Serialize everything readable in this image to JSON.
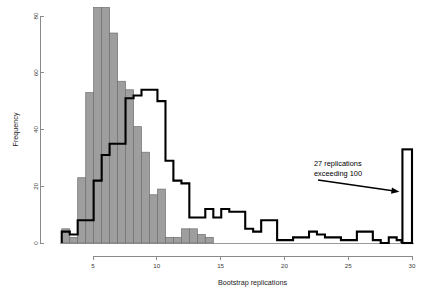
{
  "chart_data": {
    "type": "bar",
    "title": "",
    "subtitle": "",
    "xlabel": "Bootstrap replications",
    "ylabel": "Frequency",
    "xlim": [
      2.2,
      30.2
    ],
    "ylim": [
      0,
      84
    ],
    "grid": false,
    "legend_position": "none",
    "x_ticks": [
      5,
      10,
      15,
      20,
      25,
      30
    ],
    "x_tick_labels": [
      "5",
      "10",
      "15",
      "20",
      "25",
      "30"
    ],
    "y_ticks": [
      0,
      20,
      40,
      60,
      80
    ],
    "y_tick_labels": [
      "0",
      "20",
      "40",
      "60",
      "80"
    ],
    "bin_width": 0.625,
    "annotations": [
      {
        "name": "overflow-note",
        "line1": "27 replications",
        "line2": "exceeding 100",
        "points_to": "overflow-bar",
        "value": 27
      }
    ],
    "series": [
      {
        "name": "gray-histogram",
        "style": "filled-bars",
        "color": "#9e9e9e",
        "edge_color": "#6f6f6f",
        "bins": [
          {
            "x0": 2.55,
            "x1": 3.18,
            "value": 5
          },
          {
            "x0": 3.18,
            "x1": 3.8,
            "value": 2
          },
          {
            "x0": 3.8,
            "x1": 4.43,
            "value": 23
          },
          {
            "x0": 4.43,
            "x1": 5.05,
            "value": 53
          },
          {
            "x0": 5.05,
            "x1": 5.68,
            "value": 83
          },
          {
            "x0": 5.68,
            "x1": 6.3,
            "value": 83
          },
          {
            "x0": 6.3,
            "x1": 6.93,
            "value": 74
          },
          {
            "x0": 6.93,
            "x1": 7.55,
            "value": 57
          },
          {
            "x0": 7.55,
            "x1": 8.18,
            "value": 54
          },
          {
            "x0": 8.18,
            "x1": 8.8,
            "value": 41
          },
          {
            "x0": 8.8,
            "x1": 9.43,
            "value": 32
          },
          {
            "x0": 9.43,
            "x1": 10.05,
            "value": 17
          },
          {
            "x0": 10.05,
            "x1": 10.68,
            "value": 19
          },
          {
            "x0": 10.68,
            "x1": 11.3,
            "value": 2
          },
          {
            "x0": 11.3,
            "x1": 11.93,
            "value": 2
          },
          {
            "x0": 11.93,
            "x1": 12.55,
            "value": 5
          },
          {
            "x0": 12.55,
            "x1": 13.18,
            "value": 5
          },
          {
            "x0": 13.18,
            "x1": 13.8,
            "value": 3
          },
          {
            "x0": 13.8,
            "x1": 14.43,
            "value": 2
          }
        ]
      },
      {
        "name": "black-outline-histogram",
        "style": "step-outline",
        "color": "#000000",
        "bins": [
          {
            "x0": 2.55,
            "x1": 3.18,
            "value": 4
          },
          {
            "x0": 3.18,
            "x1": 3.8,
            "value": 3
          },
          {
            "x0": 3.8,
            "x1": 4.43,
            "value": 8
          },
          {
            "x0": 4.43,
            "x1": 5.05,
            "value": 8
          },
          {
            "x0": 5.05,
            "x1": 5.68,
            "value": 22
          },
          {
            "x0": 5.68,
            "x1": 6.3,
            "value": 31
          },
          {
            "x0": 6.3,
            "x1": 6.93,
            "value": 35
          },
          {
            "x0": 6.93,
            "x1": 7.55,
            "value": 35
          },
          {
            "x0": 7.55,
            "x1": 8.18,
            "value": 51
          },
          {
            "x0": 8.18,
            "x1": 8.8,
            "value": 52
          },
          {
            "x0": 8.8,
            "x1": 9.43,
            "value": 54
          },
          {
            "x0": 9.43,
            "x1": 10.05,
            "value": 54
          },
          {
            "x0": 10.05,
            "x1": 10.68,
            "value": 50
          },
          {
            "x0": 10.68,
            "x1": 11.3,
            "value": 29
          },
          {
            "x0": 11.3,
            "x1": 11.93,
            "value": 22
          },
          {
            "x0": 11.93,
            "x1": 12.55,
            "value": 21
          },
          {
            "x0": 12.55,
            "x1": 13.18,
            "value": 9
          },
          {
            "x0": 13.18,
            "x1": 13.8,
            "value": 9
          },
          {
            "x0": 13.8,
            "x1": 14.43,
            "value": 12
          },
          {
            "x0": 14.43,
            "x1": 15.05,
            "value": 9
          },
          {
            "x0": 15.05,
            "x1": 15.68,
            "value": 12
          },
          {
            "x0": 15.68,
            "x1": 16.3,
            "value": 11
          },
          {
            "x0": 16.3,
            "x1": 16.93,
            "value": 11
          },
          {
            "x0": 16.93,
            "x1": 17.55,
            "value": 5
          },
          {
            "x0": 17.55,
            "x1": 18.18,
            "value": 4
          },
          {
            "x0": 18.18,
            "x1": 18.8,
            "value": 8
          },
          {
            "x0": 18.8,
            "x1": 19.43,
            "value": 8
          },
          {
            "x0": 19.43,
            "x1": 20.05,
            "value": 1
          },
          {
            "x0": 20.05,
            "x1": 20.68,
            "value": 1
          },
          {
            "x0": 20.68,
            "x1": 21.3,
            "value": 2
          },
          {
            "x0": 21.3,
            "x1": 21.93,
            "value": 2
          },
          {
            "x0": 21.93,
            "x1": 22.55,
            "value": 4
          },
          {
            "x0": 22.55,
            "x1": 23.18,
            "value": 3
          },
          {
            "x0": 23.18,
            "x1": 23.8,
            "value": 2
          },
          {
            "x0": 23.8,
            "x1": 24.43,
            "value": 2
          },
          {
            "x0": 24.43,
            "x1": 25.05,
            "value": 1
          },
          {
            "x0": 25.05,
            "x1": 25.68,
            "value": 1
          },
          {
            "x0": 25.68,
            "x1": 26.3,
            "value": 4
          },
          {
            "x0": 26.3,
            "x1": 26.93,
            "value": 4
          },
          {
            "x0": 26.93,
            "x1": 27.55,
            "value": 1
          },
          {
            "x0": 27.55,
            "x1": 28.18,
            "value": 0
          },
          {
            "x0": 28.18,
            "x1": 28.8,
            "value": 2
          },
          {
            "x0": 28.8,
            "x1": 29.18,
            "value": 1
          }
        ]
      },
      {
        "name": "overflow-bar-series",
        "style": "open-bar",
        "color": "#ffffff",
        "edge_color": "#000000",
        "bins": [
          {
            "x0": 29.25,
            "x1": 30.0,
            "value": 33
          }
        ]
      }
    ]
  }
}
